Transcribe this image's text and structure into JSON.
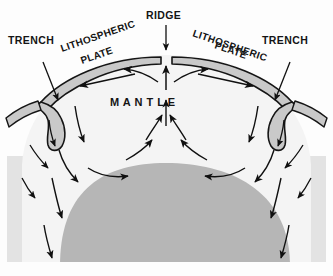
{
  "figure": {
    "labels": {
      "trench_left": "TRENCH",
      "trench_right": "TRENCH",
      "ridge": "RIDGE",
      "plate_left_line1": "LITHOSPHERIC",
      "plate_left_line2": "PLATE",
      "plate_right_line1": "LITHOSPHERIC",
      "plate_right_line2": "PLATE",
      "mantle": "M A N T L E"
    },
    "colors": {
      "background": "#fdfdfd",
      "band": "#e3e3e3",
      "core": "#b6b6b6",
      "plate_fill": "#c9c9c9",
      "mantle_fill": "#f2f2f2",
      "outline": "#151515",
      "arrow": "#101010"
    },
    "geometry": {
      "band_top": 156,
      "band_bottom": 262,
      "core_apex_y": 163,
      "core_left_x": 60,
      "core_right_x": 290
    }
  }
}
